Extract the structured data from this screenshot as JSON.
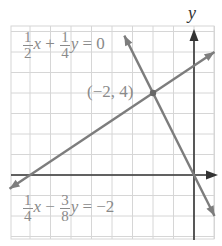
{
  "chart_data": {
    "type": "line",
    "title": "",
    "xlabel": "x",
    "ylabel": "y",
    "xlim": [
      -9,
      1
    ],
    "ylim": [
      -3,
      7
    ],
    "grid": true,
    "series": [
      {
        "name": "1/2 x + 1/4 y = 0",
        "equation": "y = -2x",
        "x": [
          -3.4,
          1
        ],
        "y": [
          6.8,
          -2
        ]
      },
      {
        "name": "1/4 x - 3/8 y = -2",
        "equation": "y = (2/3)x + 16/3",
        "x": [
          -9,
          1
        ],
        "y": [
          -0.67,
          6
        ]
      }
    ],
    "annotations": [
      {
        "text": "(−2, 4)",
        "x": -2,
        "y": 4,
        "type": "intersection-point"
      }
    ]
  },
  "labels": {
    "eq1": {
      "a_num": "1",
      "a_den": "2",
      "var1": "x",
      "op": "+",
      "b_num": "1",
      "b_den": "4",
      "var2": "y",
      "rhs": "= 0"
    },
    "eq2": {
      "a_num": "1",
      "a_den": "4",
      "var1": "x",
      "op": "−",
      "b_num": "3",
      "b_den": "8",
      "var2": "y",
      "rhs": "= −2"
    },
    "point": "(−2, 4)",
    "y_axis": "y",
    "x_axis": "x"
  },
  "colors": {
    "grid": "#d4d4d4",
    "axis": "#333333",
    "line": "#7d7d7d",
    "text": "#8a8a8a"
  }
}
